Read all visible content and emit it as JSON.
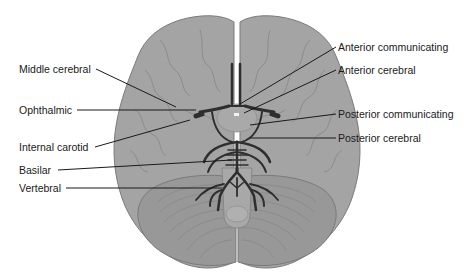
{
  "diagram": {
    "colors": {
      "background": "#ffffff",
      "brain_fill": "#a3a3a3",
      "brain_outline": "#7a7a7a",
      "cerebellum_fill": "#969696",
      "artery": "#2e2e2e",
      "leader_line": "#1a1a1a",
      "label_text": "#1a1a1a"
    },
    "labels_left": [
      {
        "id": "middle-cerebral",
        "text": "Middle cerebral"
      },
      {
        "id": "ophthalmic",
        "text": "Ophthalmic"
      },
      {
        "id": "internal-carotid",
        "text": "Internal carotid"
      },
      {
        "id": "basilar",
        "text": "Basilar"
      },
      {
        "id": "vertebral",
        "text": "Vertebral"
      }
    ],
    "labels_right": [
      {
        "id": "anterior-communicating",
        "text": "Anterior communicating"
      },
      {
        "id": "anterior-cerebral",
        "text": "Anterior cerebral"
      },
      {
        "id": "posterior-communicating",
        "text": "Posterior communicating"
      },
      {
        "id": "posterior-cerebral",
        "text": "Posterior cerebral"
      }
    ]
  }
}
